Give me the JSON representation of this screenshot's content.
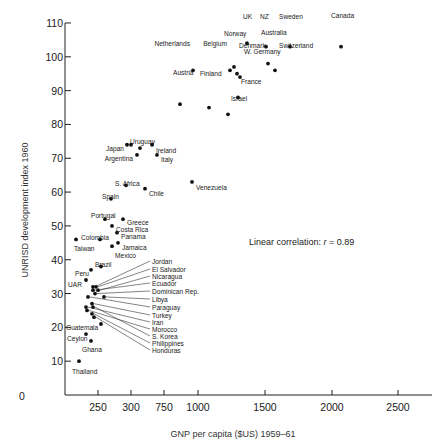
{
  "chart_data": {
    "type": "scatter",
    "title": "",
    "xlabel": "GNP per capita ($US) 1959–61",
    "ylabel": "UNRISD development index 1960",
    "annotation": "Linear correlation: r = 0.89",
    "annotation_prefix": "Linear correlation: ",
    "annotation_r": "r",
    "annotation_value": " = 0.89",
    "ylim": [
      0,
      110
    ],
    "yticks": [
      10,
      20,
      30,
      40,
      50,
      60,
      70,
      80,
      90,
      100,
      110
    ],
    "y_origin_label": "0",
    "xticks": [
      {
        "value": 250,
        "label": "250",
        "px": 98
      },
      {
        "value": 300,
        "label": "300",
        "px": 131
      },
      {
        "value": 750,
        "label": "750",
        "px": 164
      },
      {
        "value": 1000,
        "label": "1000",
        "px": 198
      },
      {
        "value": 1500,
        "label": "1500",
        "px": 265
      },
      {
        "value": 2000,
        "label": "2000",
        "px": 332
      },
      {
        "value": 2500,
        "label": "2500",
        "px": 398
      }
    ],
    "grid": false,
    "legend": null,
    "points": [
      {
        "name": "UK",
        "px": 247,
        "y": 104,
        "lx": 243,
        "ly": 14,
        "anchor": "start"
      },
      {
        "name": "NZ",
        "px": 266,
        "y": 103,
        "lx": 260,
        "ly": 14,
        "anchor": "start"
      },
      {
        "name": "Sweden",
        "px": 290,
        "y": 103,
        "lx": 279,
        "ly": 14,
        "anchor": "start"
      },
      {
        "name": "Canada",
        "px": 341,
        "y": 103,
        "lx": 331,
        "ly": 13,
        "anchor": "start"
      },
      {
        "name": "Norway",
        "px": 234,
        "y": 97,
        "lx": 224,
        "ly": 31,
        "anchor": "start"
      },
      {
        "name": "Australia",
        "px": 268,
        "y": 98,
        "lx": 261,
        "ly": 30,
        "anchor": "start"
      },
      {
        "name": "Netherlands",
        "px": 193,
        "y": 96,
        "lx": 190,
        "ly": 41,
        "anchor": "end"
      },
      {
        "name": "Belgium",
        "px": 230,
        "y": 96,
        "lx": 227,
        "ly": 41,
        "anchor": "end"
      },
      {
        "name": "Denmark",
        "px": 237,
        "y": 95,
        "lx": 239,
        "ly": 43,
        "anchor": "start"
      },
      {
        "name": "Switzerland",
        "px": 275,
        "y": 96,
        "lx": 279,
        "ly": 43,
        "anchor": "start"
      },
      {
        "name": "W. Germany",
        "px": 240,
        "y": 94,
        "lx": 244,
        "ly": 49,
        "anchor": "start"
      },
      {
        "name": "Austria",
        "px": 180,
        "y": 86,
        "lx": 173,
        "ly": 70,
        "anchor": "start"
      },
      {
        "name": "Finland",
        "px": 209,
        "y": 85,
        "lx": 200,
        "ly": 71,
        "anchor": "start"
      },
      {
        "name": "France",
        "px": 238,
        "y": 88,
        "lx": 241,
        "ly": 79,
        "anchor": "start"
      },
      {
        "name": "Israel",
        "px": 228,
        "y": 83,
        "lx": 231,
        "ly": 96,
        "anchor": "start"
      },
      {
        "name": "Japan",
        "px": 127,
        "y": 74,
        "lx": 124,
        "ly": 146,
        "anchor": "end"
      },
      {
        "name": "Japan2",
        "hidden_label": true,
        "px": 131,
        "y": 74
      },
      {
        "name": "Uruguay",
        "px": 140,
        "y": 73,
        "lx": 130,
        "ly": 139,
        "anchor": "start"
      },
      {
        "name": "Ireland",
        "px": 152,
        "y": 74,
        "lx": 156,
        "ly": 148,
        "anchor": "start"
      },
      {
        "name": "Argentina",
        "px": 137,
        "y": 71,
        "lx": 133,
        "ly": 156,
        "anchor": "end"
      },
      {
        "name": "Italy",
        "px": 157,
        "y": 71,
        "lx": 161,
        "ly": 157,
        "anchor": "start"
      },
      {
        "name": "S. Africa",
        "px": 126,
        "y": 62,
        "lx": 115,
        "ly": 181,
        "anchor": "start"
      },
      {
        "name": "Chile",
        "px": 145,
        "y": 61,
        "lx": 149,
        "ly": 191,
        "anchor": "start"
      },
      {
        "name": "Venezuela",
        "px": 192,
        "y": 63,
        "lx": 196,
        "ly": 185,
        "anchor": "start"
      },
      {
        "name": "Spain",
        "px": 111,
        "y": 58,
        "lx": 102,
        "ly": 194,
        "anchor": "start"
      },
      {
        "name": "Portugal",
        "px": 105,
        "y": 52,
        "lx": 91,
        "ly": 213,
        "anchor": "start"
      },
      {
        "name": "Greece",
        "px": 123,
        "y": 52,
        "lx": 127,
        "ly": 220,
        "anchor": "start"
      },
      {
        "name": "Costa Rica",
        "px": 112,
        "y": 50,
        "lx": 116,
        "ly": 227,
        "anchor": "start"
      },
      {
        "name": "Panama",
        "px": 117,
        "y": 48,
        "lx": 121,
        "ly": 234,
        "anchor": "start"
      },
      {
        "name": "Colombia",
        "px": 100,
        "y": 46,
        "lx": 81,
        "ly": 235,
        "anchor": "start"
      },
      {
        "name": "Taiwan",
        "px": 76,
        "y": 46,
        "lx": 74,
        "ly": 246,
        "anchor": "start"
      },
      {
        "name": "Jamaica",
        "px": 118,
        "y": 45,
        "lx": 122,
        "ly": 245,
        "anchor": "start"
      },
      {
        "name": "Mexico",
        "px": 112,
        "y": 44,
        "lx": 115,
        "ly": 253,
        "anchor": "start"
      },
      {
        "name": "Brazil",
        "px": 101,
        "y": 38,
        "lx": 95,
        "ly": 262,
        "anchor": "start"
      },
      {
        "name": "Peru",
        "px": 91,
        "y": 37,
        "lx": 75,
        "ly": 271,
        "anchor": "start"
      },
      {
        "name": "UAR",
        "px": 86,
        "y": 34,
        "lx": 68,
        "ly": 282,
        "anchor": "start"
      },
      {
        "name": "Guatemala",
        "px": 101,
        "y": 21,
        "lx": 66,
        "ly": 325,
        "anchor": "start"
      },
      {
        "name": "Ceylon",
        "px": 86,
        "y": 18,
        "lx": 67,
        "ly": 336,
        "anchor": "start"
      },
      {
        "name": "Ghana",
        "px": 91,
        "y": 16,
        "lx": 82,
        "ly": 347,
        "anchor": "start"
      },
      {
        "name": "Thailand",
        "px": 79,
        "y": 10,
        "lx": 72,
        "ly": 369,
        "anchor": "start"
      }
    ],
    "leader_labels": {
      "x": 152,
      "items": [
        {
          "name": "Jordan",
          "ly": 261,
          "px": 93,
          "y": 32
        },
        {
          "name": "El Salvador",
          "ly": 269,
          "px": 96,
          "y": 32
        },
        {
          "name": "Nicaragua",
          "ly": 276,
          "px": 98,
          "y": 31
        },
        {
          "name": "Ecuador",
          "ly": 283,
          "px": 93,
          "y": 31
        },
        {
          "name": "Dominican Rep.",
          "ly": 291,
          "px": 95,
          "y": 30
        },
        {
          "name": "Libya",
          "ly": 299,
          "px": 104,
          "y": 29
        },
        {
          "name": "Paraguay",
          "ly": 307,
          "px": 88,
          "y": 29
        },
        {
          "name": "Turkey",
          "ly": 315,
          "px": 92,
          "y": 27
        },
        {
          "name": "Iran",
          "ly": 322,
          "px": 86,
          "y": 26
        },
        {
          "name": "Morocco",
          "ly": 329,
          "px": 87,
          "y": 25
        },
        {
          "name": "S. Korea",
          "ly": 336,
          "px": 93,
          "y": 26
        },
        {
          "name": "Philippines",
          "ly": 343,
          "px": 92,
          "y": 24
        },
        {
          "name": "Honduras",
          "ly": 350,
          "px": 94,
          "y": 23
        }
      ]
    }
  }
}
